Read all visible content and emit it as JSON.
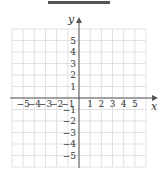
{
  "answer_blank": {
    "visible": true
  },
  "chart_data": {
    "type": "coordinate-grid",
    "title": "",
    "xlabel": "x",
    "ylabel": "y",
    "xlim": [
      -6,
      6
    ],
    "ylim": [
      -6,
      6
    ],
    "grid": true,
    "x_ticks": [
      -5,
      -4,
      -3,
      -2,
      -1,
      1,
      2,
      3,
      4,
      5
    ],
    "y_ticks": [
      5,
      4,
      3,
      2,
      1,
      -1,
      -2,
      -3,
      -4,
      -5
    ],
    "x_tick_labels": [
      "−5",
      "−4",
      "−3",
      "−2",
      "−1",
      "1",
      "2",
      "3",
      "4",
      "5"
    ],
    "y_tick_labels": [
      "5",
      "4",
      "3",
      "2",
      "1",
      "−1",
      "−2",
      "−3",
      "−4",
      "−5"
    ],
    "series": [],
    "colors": {
      "grid": "#d9d9d9",
      "axis": "#555555",
      "text": "#333333"
    }
  }
}
